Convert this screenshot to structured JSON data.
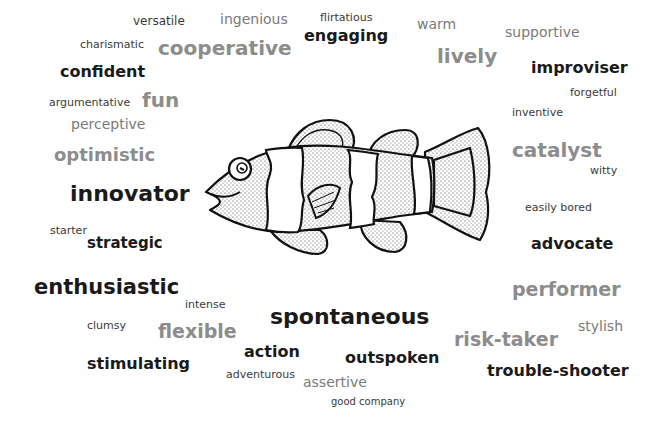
{
  "figure": {
    "type": "word-cloud",
    "center_image": "clownfish-drawing",
    "words": [
      {
        "text": "versatile",
        "weight": "light",
        "shade": "dark"
      },
      {
        "text": "ingenious",
        "weight": "light",
        "shade": "gray"
      },
      {
        "text": "flirtatious",
        "weight": "light",
        "shade": "dark"
      },
      {
        "text": "warm",
        "weight": "light",
        "shade": "gray"
      },
      {
        "text": "supportive",
        "weight": "light",
        "shade": "gray"
      },
      {
        "text": "charismatic",
        "weight": "light",
        "shade": "dark"
      },
      {
        "text": "cooperative",
        "weight": "bold",
        "shade": "gray"
      },
      {
        "text": "engaging",
        "weight": "bold",
        "shade": "dark"
      },
      {
        "text": "lively",
        "weight": "bold",
        "shade": "gray"
      },
      {
        "text": "confident",
        "weight": "bold",
        "shade": "dark"
      },
      {
        "text": "improviser",
        "weight": "bold",
        "shade": "dark"
      },
      {
        "text": "argumentative",
        "weight": "light",
        "shade": "dark"
      },
      {
        "text": "fun",
        "weight": "bold",
        "shade": "gray"
      },
      {
        "text": "forgetful",
        "weight": "light",
        "shade": "dark"
      },
      {
        "text": "inventive",
        "weight": "light",
        "shade": "dark"
      },
      {
        "text": "perceptive",
        "weight": "light",
        "shade": "gray"
      },
      {
        "text": "optimistic",
        "weight": "bold",
        "shade": "gray"
      },
      {
        "text": "catalyst",
        "weight": "bold",
        "shade": "gray"
      },
      {
        "text": "witty",
        "weight": "light",
        "shade": "dark"
      },
      {
        "text": "innovator",
        "weight": "bold",
        "shade": "dark"
      },
      {
        "text": "easily bored",
        "weight": "light",
        "shade": "dark"
      },
      {
        "text": "starter",
        "weight": "light",
        "shade": "dark"
      },
      {
        "text": "strategic",
        "weight": "bold",
        "shade": "dark"
      },
      {
        "text": "advocate",
        "weight": "bold",
        "shade": "dark"
      },
      {
        "text": "enthusiastic",
        "weight": "bold",
        "shade": "dark"
      },
      {
        "text": "performer",
        "weight": "bold",
        "shade": "gray"
      },
      {
        "text": "intense",
        "weight": "light",
        "shade": "dark"
      },
      {
        "text": "spontaneous",
        "weight": "bold",
        "shade": "dark"
      },
      {
        "text": "clumsy",
        "weight": "light",
        "shade": "dark"
      },
      {
        "text": "flexible",
        "weight": "bold",
        "shade": "gray"
      },
      {
        "text": "stylish",
        "weight": "light",
        "shade": "gray"
      },
      {
        "text": "risk-taker",
        "weight": "bold",
        "shade": "gray"
      },
      {
        "text": "action",
        "weight": "bold",
        "shade": "dark"
      },
      {
        "text": "outspoken",
        "weight": "bold",
        "shade": "dark"
      },
      {
        "text": "stimulating",
        "weight": "bold",
        "shade": "dark"
      },
      {
        "text": "trouble-shooter",
        "weight": "bold",
        "shade": "dark"
      },
      {
        "text": "adventurous",
        "weight": "light",
        "shade": "dark"
      },
      {
        "text": "assertive",
        "weight": "light",
        "shade": "gray"
      },
      {
        "text": "good company",
        "weight": "light",
        "shade": "dark"
      }
    ]
  }
}
